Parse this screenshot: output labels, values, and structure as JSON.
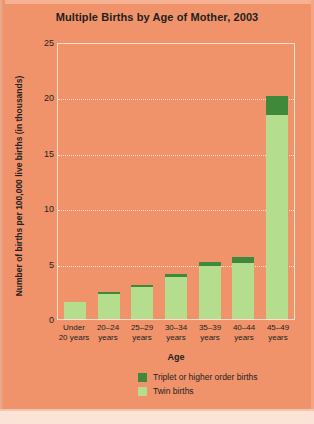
{
  "figure": {
    "background_color": "#F0936B",
    "title": "Multiple Births by Age of Mother, 2003"
  },
  "axes": {
    "x_title": "Age",
    "y_title": "Number of births per 100,000 live births (in thousands)"
  },
  "legend": {
    "items": [
      {
        "label": "Triplet or higher order births",
        "color": "#3E8A3A"
      },
      {
        "label": "Twin births",
        "color": "#B5DD8E"
      }
    ]
  },
  "chart_data": {
    "type": "bar",
    "title": "Multiple Births by Age of Mother, 2003",
    "subtitle": "",
    "xlabel": "Age",
    "ylabel": "Number of births per 100,000 live births (in thousands)",
    "stacked": true,
    "grid": true,
    "legend_position": "bottom-right",
    "ylim": [
      0,
      25
    ],
    "yticks": [
      0,
      5,
      10,
      15,
      20,
      25
    ],
    "ytick_labels": [
      "0",
      "5",
      "10",
      "15",
      "20",
      "25"
    ],
    "categories": [
      "Under 20 years",
      "20–24 years",
      "25–29 years",
      "30–34 years",
      "35–39 years",
      "40–44 years",
      "45–49 years"
    ],
    "category_lines": [
      [
        "Under",
        "20 years"
      ],
      [
        "20–24",
        "years"
      ],
      [
        "25–29",
        "years"
      ],
      [
        "30–34",
        "years"
      ],
      [
        "35–39",
        "years"
      ],
      [
        "40–44",
        "years"
      ],
      [
        "45–49",
        "years"
      ]
    ],
    "series": [
      {
        "name": "Twin births",
        "color": "#B5DD8E",
        "values": [
          1.5,
          2.3,
          2.9,
          3.8,
          4.8,
          5.1,
          18.4
        ]
      },
      {
        "name": "Triplet or higher order births",
        "color": "#3E8A3A",
        "values": [
          0.0,
          0.15,
          0.2,
          0.3,
          0.35,
          0.5,
          1.7
        ]
      }
    ],
    "totals": [
      1.5,
      2.45,
      3.1,
      4.1,
      5.15,
      5.6,
      20.1
    ]
  }
}
